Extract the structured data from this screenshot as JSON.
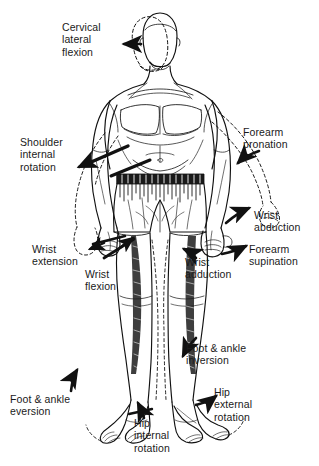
{
  "figure": {
    "line_color": "#111111",
    "background_color": "#ffffff",
    "text_color": "#1a1a1a"
  },
  "labels": [
    {
      "id": "cervical-lateral-flexion",
      "text": "Cervical\nlateral\nflexion",
      "x": 62,
      "y": 21,
      "align": "left",
      "body_part": "neck"
    },
    {
      "id": "shoulder-internal-rotation",
      "text": "Shoulder\ninternal\nrotation",
      "x": 20,
      "y": 136,
      "align": "left",
      "body_part": "shoulder"
    },
    {
      "id": "forearm-pronation",
      "text": "Forearm\npronation",
      "x": 243,
      "y": 126,
      "align": "left",
      "body_part": "forearm"
    },
    {
      "id": "wrist-extension",
      "text": "Wrist\nextension",
      "x": 32,
      "y": 243,
      "align": "left",
      "body_part": "wrist"
    },
    {
      "id": "wrist-flexion",
      "text": "Wrist\nflexion",
      "x": 85,
      "y": 268,
      "align": "left",
      "body_part": "wrist"
    },
    {
      "id": "wrist-abduction",
      "text": "Wrist\nabduction",
      "x": 254,
      "y": 209,
      "align": "left",
      "body_part": "wrist"
    },
    {
      "id": "forearm-supination",
      "text": "Forearm\nsupination",
      "x": 249,
      "y": 243,
      "align": "left",
      "body_part": "forearm"
    },
    {
      "id": "wrist-adduction",
      "text": "Wrist\nadduction",
      "x": 185,
      "y": 256,
      "align": "left",
      "body_part": "wrist"
    },
    {
      "id": "foot-ankle-inversion",
      "text": "Foot & ankle\ninversion",
      "x": 186,
      "y": 342,
      "align": "left",
      "body_part": "foot-ankle"
    },
    {
      "id": "hip-external-rotation",
      "text": "Hip\nexternal\nrotation",
      "x": 214,
      "y": 386,
      "align": "left",
      "body_part": "hip"
    },
    {
      "id": "hip-internal-rotation",
      "text": "Hip\ninternal\nrotation",
      "x": 134,
      "y": 417,
      "align": "left",
      "body_part": "hip"
    },
    {
      "id": "foot-ankle-eversion",
      "text": "Foot & ankle\neversion",
      "x": 10,
      "y": 393,
      "align": "left",
      "body_part": "foot-ankle"
    }
  ]
}
